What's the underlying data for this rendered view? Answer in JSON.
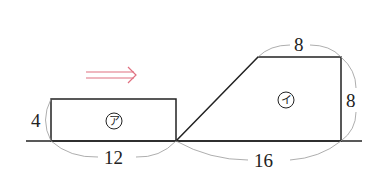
{
  "figure": {
    "rectangle": {
      "name": "ア",
      "height_label": "4",
      "width_label": "12"
    },
    "trapezoid": {
      "name": "イ",
      "top_label": "8",
      "height_label": "8",
      "bottom_label": "16"
    },
    "arrow": {
      "direction": "right",
      "color": "#e07080"
    }
  }
}
